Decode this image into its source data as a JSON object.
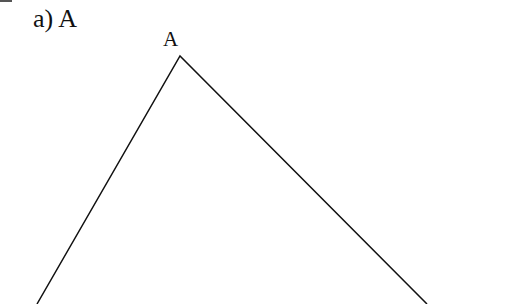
{
  "figure": {
    "part_label": "a) A",
    "vertex_label": "A",
    "triangle": {
      "apex": [
        180,
        56
      ],
      "left_end": [
        37,
        304
      ],
      "right_end": [
        427,
        304
      ],
      "stroke": "#111111"
    }
  }
}
